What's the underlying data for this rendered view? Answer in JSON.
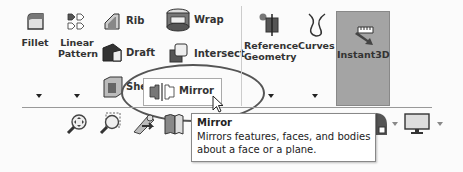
{
  "ribbon": {
    "fillet": {
      "label": "Fillet"
    },
    "linear_pattern": {
      "label_line1": "Linear",
      "label_line2": "Pattern"
    },
    "rib": {
      "label": "Rib"
    },
    "draft": {
      "label": "Draft"
    },
    "shell": {
      "label": "Shell"
    },
    "wrap": {
      "label": "Wrap"
    },
    "intersect": {
      "label": "Intersect"
    },
    "mirror": {
      "label": "Mirror"
    },
    "reference_geometry": {
      "label_line1": "Reference",
      "label_line2": "Geometry"
    },
    "curves": {
      "label": "Curves"
    },
    "instant3d": {
      "label": "Instant3D",
      "state": "active"
    }
  },
  "view_toolbar": {
    "icons": [
      "zoom-to-fit-icon",
      "zoom-to-area-icon",
      "previous-view-icon",
      "section-view-icon",
      "display-style-icon",
      "monitor-icon"
    ]
  },
  "tooltip": {
    "title": "Mirror",
    "description_line1": "Mirrors features, faces, and bodies",
    "description_line2": "about a face or a plane."
  },
  "colors": {
    "instant3d_active_bg": "#a4a4a4",
    "highlight_ellipse": "#555555"
  }
}
